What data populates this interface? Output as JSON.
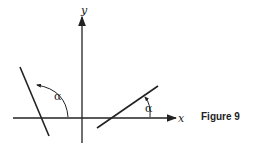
{
  "figure": {
    "caption": "Figure 9",
    "axis_labels": {
      "x": "x",
      "y": "y"
    },
    "angle_label": "α",
    "colors": {
      "ink": "#222222",
      "background": "#ffffff"
    },
    "lines": [
      {
        "name": "left-line",
        "x1": 20,
        "y1": 67,
        "x2": 49,
        "y2": 136
      },
      {
        "name": "right-line",
        "x1": 97,
        "y1": 128,
        "x2": 158,
        "y2": 86
      }
    ]
  }
}
